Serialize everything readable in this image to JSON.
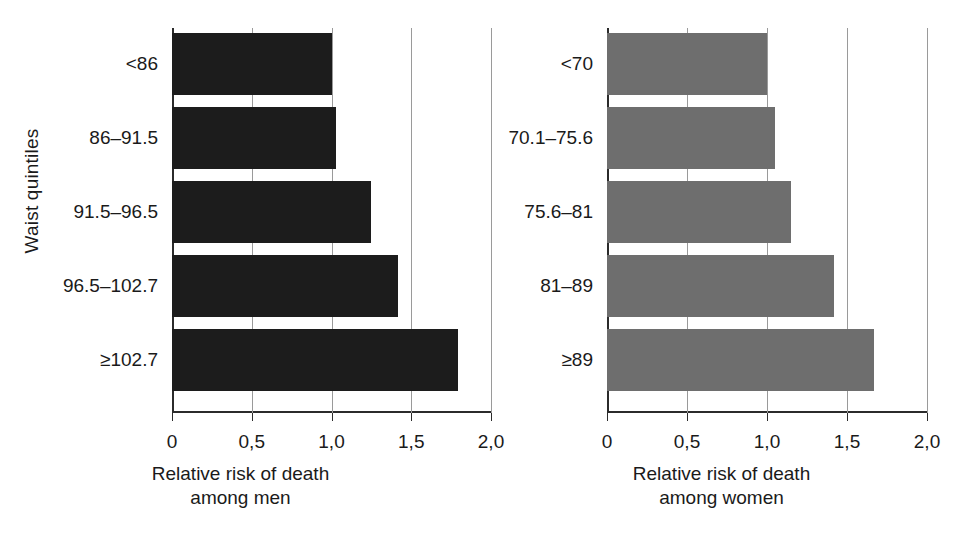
{
  "chart_data": [
    {
      "type": "bar",
      "orientation": "horizontal",
      "title": "",
      "xlabel": "Relative risk of death among men",
      "xlabel_line1": "Relative risk of death",
      "xlabel_line2": "among men",
      "ylabel": "Waist quintiles",
      "categories": [
        "<86",
        "86–91.5",
        "91.5–96.5",
        "96.5–102.7",
        "≥102.7"
      ],
      "values": [
        1.0,
        1.03,
        1.25,
        1.42,
        1.79
      ],
      "xlim": [
        0,
        2.0
      ],
      "xticks": [
        0,
        0.5,
        1.0,
        1.5,
        2.0
      ],
      "xtick_labels": [
        "0",
        "0,5",
        "1,0",
        "1,5",
        "2,0"
      ],
      "grid": "vertical",
      "legend": "none",
      "bar_color": "#1c1c1c"
    },
    {
      "type": "bar",
      "orientation": "horizontal",
      "title": "",
      "xlabel": "Relative risk of death among women",
      "xlabel_line1": "Relative risk of death",
      "xlabel_line2": "among women",
      "ylabel": "",
      "categories": [
        "<70",
        "70.1–75.6",
        "75.6–81",
        "81–89",
        "≥89"
      ],
      "values": [
        1.0,
        1.05,
        1.15,
        1.42,
        1.67
      ],
      "xlim": [
        0,
        2.0
      ],
      "xticks": [
        0,
        0.5,
        1.0,
        1.5,
        2.0
      ],
      "xtick_labels": [
        "0",
        "0,5",
        "1,0",
        "1,5",
        "2,0"
      ],
      "grid": "vertical",
      "legend": "none",
      "bar_color": "#6e6e6e"
    }
  ],
  "panels": {
    "men": {
      "y_axis_title": "Waist quintiles",
      "x_axis_title_line1": "Relative risk of death",
      "x_axis_title_line2": "among men",
      "categories": [
        "<86",
        "86–91.5",
        "91.5–96.5",
        "96.5–102.7",
        "≥102.7"
      ],
      "tick_labels": [
        "0",
        "0,5",
        "1,0",
        "1,5",
        "2,0"
      ]
    },
    "women": {
      "x_axis_title_line1": "Relative risk of death",
      "x_axis_title_line2": "among women",
      "categories": [
        "<70",
        "70.1–75.6",
        "75.6–81",
        "81–89",
        "≥89"
      ],
      "tick_labels": [
        "0",
        "0,5",
        "1,0",
        "1,5",
        "2,0"
      ]
    }
  },
  "colors": {
    "men_bar": "#1c1c1c",
    "women_bar": "#6e6e6e",
    "axis": "#2b2b2b",
    "grid": "#9a9a9a",
    "text": "#1a1a1a",
    "background": "#ffffff"
  }
}
